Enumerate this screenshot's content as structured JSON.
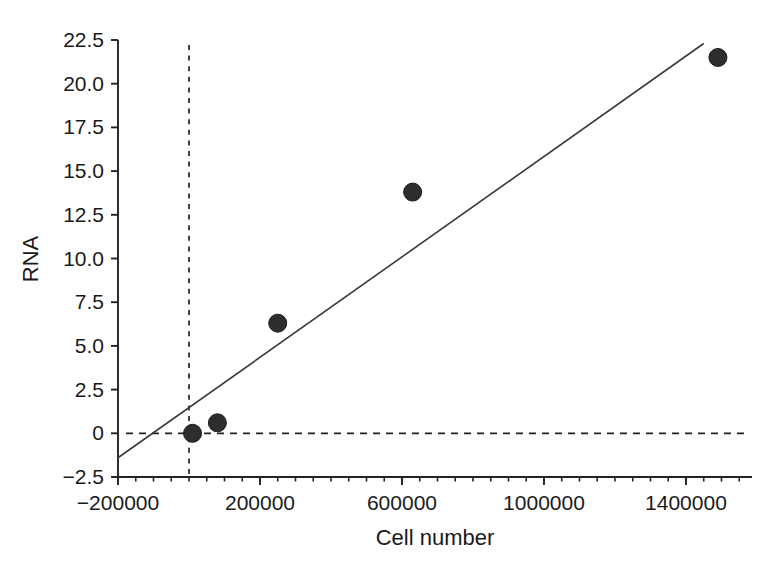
{
  "figure": {
    "background": "#ffffff",
    "ink_color": "#1f1f1f",
    "axis_color": "#222222",
    "line_color": "#3a3a3a"
  },
  "chart_data": {
    "type": "scatter",
    "title": "",
    "xlabel": "Cell number",
    "ylabel": "RNA",
    "xlim": [
      -200000,
      1586000
    ],
    "ylim": [
      -2.5,
      22.5
    ],
    "x_ticks": [
      -200000,
      200000,
      600000,
      1000000,
      1400000
    ],
    "x_tick_labels": [
      "−200000",
      "200000",
      "600000",
      "1000000",
      "1400000"
    ],
    "x_minor_tick_step": 50000,
    "y_ticks": [
      -2.5,
      0,
      2.5,
      5,
      7.5,
      10,
      12.5,
      15,
      17.5,
      20,
      22.5
    ],
    "y_tick_labels": [
      "−2.5",
      "0",
      "2.5",
      "5.0",
      "7.5",
      "10.0",
      "12.5",
      "15.0",
      "17.5",
      "20.0",
      "22.5"
    ],
    "grid": false,
    "legend": false,
    "points": [
      {
        "x": 10000,
        "y": 0.0
      },
      {
        "x": 80000,
        "y": 0.6
      },
      {
        "x": 250000,
        "y": 6.3
      },
      {
        "x": 630000,
        "y": 13.8
      },
      {
        "x": 1490000,
        "y": 21.5
      }
    ],
    "regression_line": {
      "x1": -200000,
      "y1": -1.4,
      "x2": 1450000,
      "y2": 22.3
    },
    "reference_lines": {
      "horizontal_at_y": 0,
      "vertical_at_x": 0
    },
    "marker": {
      "shape": "circle",
      "radius_px": 9,
      "fill": "#2d2d2d",
      "stroke": "#1c1c1c"
    }
  }
}
